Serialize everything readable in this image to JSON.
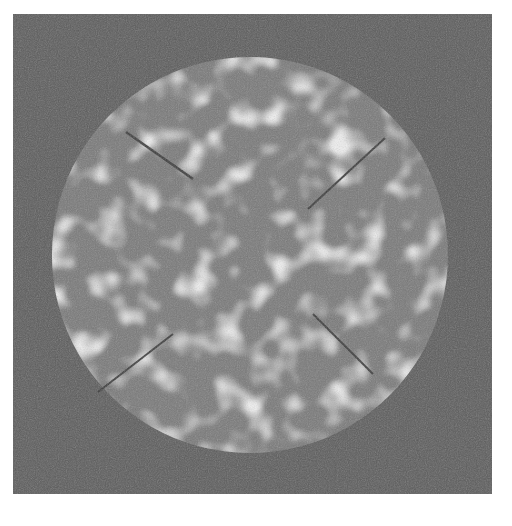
{
  "image": {
    "description": "Grayscale photograph of a circular ring made of four mottled segments with bright speckle blobs, on a dark gray noisy background; central dark D-shaped hole",
    "colors": {
      "page_background": "#ffffff",
      "photo_background": "#5d5d5d",
      "ring_base": "#7a7a7a",
      "speckle": "#d8d8d8",
      "seam": "#3a3a3a",
      "center": "#5a5a5a"
    },
    "ring": {
      "segments": 4,
      "outer_radius_px": 198,
      "inner_radius_px": 90
    }
  }
}
